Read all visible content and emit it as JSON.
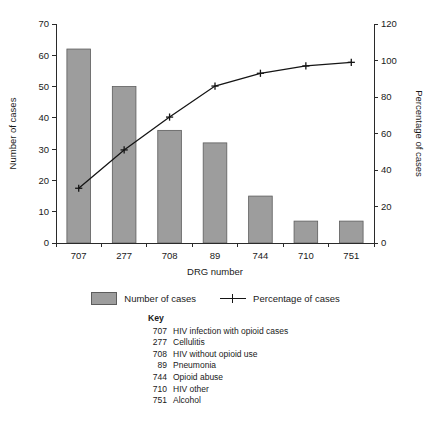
{
  "chart_data": {
    "type": "bar",
    "title": "",
    "categories": [
      "707",
      "277",
      "708",
      "89",
      "744",
      "710",
      "751"
    ],
    "xlabel": "DRG number",
    "ylabel": "Number of cases",
    "y2label": "Percentage of cases",
    "ylim": [
      0,
      70
    ],
    "y2lim": [
      0,
      120
    ],
    "yticks": [
      0,
      10,
      20,
      30,
      40,
      50,
      60,
      70
    ],
    "y2ticks": [
      0,
      20,
      40,
      60,
      80,
      100,
      120
    ],
    "grid": false,
    "legend_position": "below-plot",
    "series": [
      {
        "name": "Number of cases",
        "type": "bar",
        "axis": "left",
        "color": "#9d9d9d",
        "values": [
          62,
          50,
          36,
          32,
          15,
          7,
          7
        ]
      },
      {
        "name": "Percentage of cases",
        "type": "line",
        "axis": "right",
        "color": "#151515",
        "marker": "plus",
        "values": [
          30,
          51,
          69,
          86,
          93,
          97,
          99
        ]
      }
    ]
  },
  "legend": {
    "bar_label": "Number of cases",
    "line_label": "Percentage of cases"
  },
  "key": {
    "title": "Key",
    "rows": [
      {
        "code": "707",
        "desc": "HIV infection with opioid cases"
      },
      {
        "code": "277",
        "desc": "Cellulitis"
      },
      {
        "code": "708",
        "desc": "HIV without opioid use"
      },
      {
        "code": "89",
        "desc": "Pneumonia"
      },
      {
        "code": "744",
        "desc": "Opioid abuse"
      },
      {
        "code": "710",
        "desc": "HIV other"
      },
      {
        "code": "751",
        "desc": "Alcohol"
      }
    ]
  }
}
